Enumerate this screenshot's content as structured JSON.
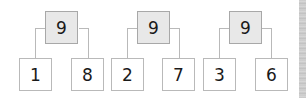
{
  "number_bonds": [
    {
      "whole": "9",
      "parts": [
        "1",
        "8"
      ]
    },
    {
      "whole": "9",
      "parts": [
        "2",
        "7"
      ]
    },
    {
      "whole": "9",
      "parts": [
        "3",
        "6"
      ]
    }
  ],
  "colors": {
    "whole_fill": "#e8e8e8",
    "part_fill": "#ffffff",
    "border": "#b9b9b9"
  }
}
